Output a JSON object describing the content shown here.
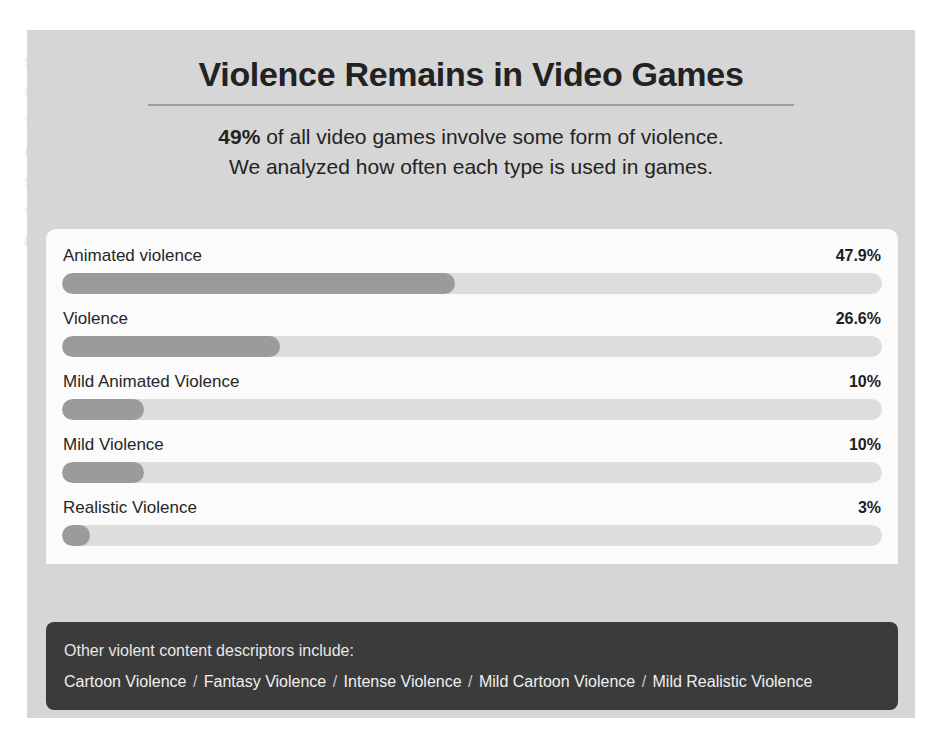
{
  "page": {
    "background_color": "#ffffff",
    "panel_color": "#d6d6d6",
    "card_color": "#fbfbfb",
    "footer_color": "#3b3b3b",
    "bar_track_color": "#dddddd",
    "bar_fill_color": "#9b9b9b",
    "ghost_text": "with the ever-increasing presence of interactive entertainment, questions about content remain. Studies show that players are sometimes exposed to imagery that designers label as violent, even when the depiction is cartoonish or highly stylized. Ratings boards attempt to capture these nuances with descriptors, yet individuals read messages from a rating differently. A descriptor such as mild animated violence may signal a very small degree of conflict, while intense violence or realistic violence indicates a much more graphic presentation. Understanding the distribution of these labels helps parents, researchers and regulators judge whether industry self-assessment is a sign of discipline or simply of convention. The present comparison may explain why otherwise similar titles receive different marks, and why aggregate figures about violence in games should always be read alongside the qualitative detail of each descriptor."
  },
  "header": {
    "title": "Violence Remains in Video Games",
    "subtitle_bold": "49%",
    "subtitle_line1_rest": " of all video games involve some form of violence.",
    "subtitle_line2": "We analyzed how often each type is used in games."
  },
  "chart_data": {
    "type": "bar",
    "orientation": "horizontal",
    "title": "Violence Remains in Video Games",
    "subtitle": "49% of all video games involve some form of violence. We analyzed how often each type is used in games.",
    "xlabel": "",
    "ylabel": "",
    "xlim": [
      0,
      100
    ],
    "grid": false,
    "legend": "none",
    "unit": "%",
    "categories": [
      "Animated violence",
      "Violence",
      "Mild Animated Violence",
      "Mild Violence",
      "Realistic Violence"
    ],
    "values": [
      47.9,
      26.6,
      10,
      10,
      3
    ],
    "value_labels": [
      "47.9%",
      "26.6%",
      "10%",
      "10%",
      "3%"
    ],
    "bars": [
      {
        "label": "Animated violence",
        "value": 47.9,
        "value_label": "47.9%"
      },
      {
        "label": "Violence",
        "value": 26.6,
        "value_label": "26.6%"
      },
      {
        "label": "Mild Animated Violence",
        "value": 10,
        "value_label": "10%"
      },
      {
        "label": "Mild Violence",
        "value": 10,
        "value_label": "10%"
      },
      {
        "label": "Realistic Violence",
        "value": 3,
        "value_label": "3%"
      }
    ]
  },
  "footer": {
    "lead": "Other violent content descriptors include:",
    "separator": "/",
    "items": [
      "Cartoon Violence",
      "Fantasy Violence",
      "Intense Violence",
      "Mild Cartoon Violence",
      "Mild Realistic Violence"
    ]
  }
}
